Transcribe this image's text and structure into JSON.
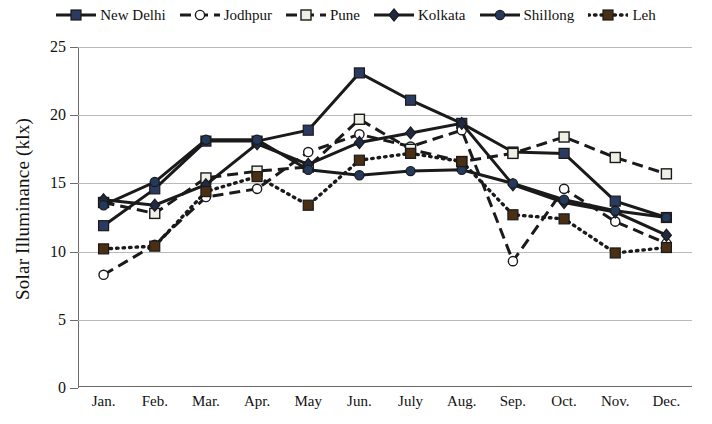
{
  "chart_data": {
    "type": "line",
    "title": "",
    "xlabel": "",
    "ylabel": "Solar Illuminance (klx)",
    "ylim": [
      0,
      25
    ],
    "yticks": [
      0,
      5,
      10,
      15,
      20,
      25
    ],
    "ytick_labels": [
      "0",
      "5",
      "10",
      "15",
      "20",
      "25"
    ],
    "grid": true,
    "legend_position": "top",
    "categories": [
      "Jan.",
      "Feb.",
      "Mar.",
      "Apr.",
      "May",
      "Jun.",
      "July",
      "Aug.",
      "Sep.",
      "Oct.",
      "Nov.",
      "Dec."
    ],
    "series": [
      {
        "name": "New Delhi",
        "color": "#1a1a1a",
        "marker": "square-filled",
        "marker_fill": "#2b3a60",
        "dash": "solid",
        "values": [
          11.9,
          14.6,
          18.1,
          18.1,
          18.9,
          23.1,
          21.1,
          19.4,
          17.3,
          17.2,
          13.7,
          12.5
        ]
      },
      {
        "name": "Jodhpur",
        "color": "#1a1a1a",
        "marker": "circle-open",
        "marker_fill": "#ffffff",
        "dash": "dashed",
        "values": [
          8.3,
          10.5,
          14.0,
          14.6,
          17.3,
          18.6,
          17.7,
          18.9,
          9.3,
          14.6,
          12.2,
          10.6
        ]
      },
      {
        "name": "Pune",
        "color": "#1a1a1a",
        "marker": "square-open",
        "marker_fill": "#eef0e6",
        "dash": "dashed",
        "values": [
          13.6,
          12.8,
          15.4,
          15.9,
          16.2,
          19.7,
          17.5,
          16.6,
          17.2,
          18.4,
          16.9,
          15.7
        ]
      },
      {
        "name": "Kolkata",
        "color": "#1a1a1a",
        "marker": "diamond-filled",
        "marker_fill": "#1f2a44",
        "dash": "solid",
        "values": [
          13.8,
          13.4,
          14.9,
          17.9,
          16.4,
          18.0,
          18.7,
          19.4,
          14.9,
          13.6,
          12.9,
          11.2
        ]
      },
      {
        "name": "Shillong",
        "color": "#1a1a1a",
        "marker": "circle-filled",
        "marker_fill": "#233a5c",
        "dash": "solid",
        "values": [
          13.4,
          15.1,
          18.2,
          18.2,
          16.0,
          15.6,
          15.9,
          16.0,
          15.0,
          13.8,
          13.0,
          12.5
        ]
      },
      {
        "name": "Leh",
        "color": "#1a1a1a",
        "marker": "square-filled",
        "marker_fill": "#4a2f14",
        "dash": "dotted",
        "values": [
          10.2,
          10.4,
          14.4,
          15.5,
          13.4,
          16.7,
          17.2,
          16.6,
          12.7,
          12.4,
          9.9,
          10.3
        ]
      }
    ]
  },
  "legend": {
    "items": [
      {
        "label": "New Delhi"
      },
      {
        "label": "Jodhpur"
      },
      {
        "label": "Pune"
      },
      {
        "label": "Kolkata"
      },
      {
        "label": "Shillong"
      },
      {
        "label": "Leh"
      }
    ]
  }
}
